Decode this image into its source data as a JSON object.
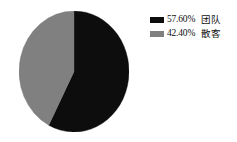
{
  "chart_data": {
    "type": "pie",
    "title": "",
    "categories": [
      "团队",
      "散客"
    ],
    "values": [
      57.6,
      42.4
    ],
    "value_unit": "%",
    "slices": [
      {
        "label": "团队",
        "value": 57.6,
        "display": "57.60%",
        "color": "#0d0d0d"
      },
      {
        "label": "散客",
        "value": 42.4,
        "display": "42.40%",
        "color": "#808080"
      }
    ],
    "legend_position": "right",
    "grid": false,
    "start_angle_deg": 0,
    "direction": "clockwise"
  },
  "legend": {
    "rows": [
      {
        "swatch": "legend-swatch-black",
        "percent": "57.60%",
        "name": "团队"
      },
      {
        "swatch": "legend-swatch-gray",
        "percent": "42.40%",
        "name": "散客"
      }
    ]
  },
  "colors": {
    "slice_team": "#0d0d0d",
    "slice_individual": "#808080",
    "background": "#ffffff",
    "text": "#111111"
  }
}
